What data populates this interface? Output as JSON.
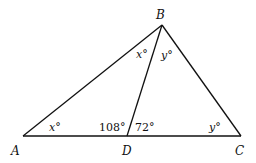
{
  "diagram": {
    "type": "triangle",
    "vertices": {
      "A": {
        "label": "A"
      },
      "B": {
        "label": "B"
      },
      "C": {
        "label": "C"
      },
      "D": {
        "label": "D"
      }
    },
    "segments": [
      "AB",
      "BC",
      "AC",
      "BD"
    ],
    "angles": {
      "BAD": "x°",
      "ABD": "x°",
      "DBC": "y°",
      "BCD": "y°",
      "ADB": "108°",
      "BDC": "72°"
    }
  }
}
